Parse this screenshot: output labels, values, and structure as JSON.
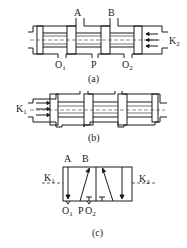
{
  "figure": {
    "panels": [
      {
        "id": "a",
        "caption": "(a)",
        "description": "Spool valve cross-section, spool shifted left by pilot K2",
        "ports": {
          "A": "A",
          "B": "B",
          "P": "P",
          "O1": "O",
          "O1_sub": "1",
          "O2": "O",
          "O2_sub": "2"
        },
        "pilot": {
          "label": "K",
          "sub": "2",
          "side": "right"
        }
      },
      {
        "id": "b",
        "caption": "(b)",
        "description": "Spool valve cross-section, spool shifted right by pilot K1",
        "pilot": {
          "label": "K",
          "sub": "1",
          "side": "left"
        }
      },
      {
        "id": "c",
        "caption": "(c)",
        "description": "Graphic symbol of 2-position 5-way pilot-operated valve",
        "ports": {
          "A": "A",
          "B": "B",
          "P": "P",
          "O1": "O",
          "O1_sub": "1",
          "O2": "O",
          "O2_sub": "2"
        },
        "pilots": [
          {
            "label": "K",
            "sub": "1",
            "side": "left"
          },
          {
            "label": "K",
            "sub": "2",
            "side": "right"
          }
        ]
      }
    ],
    "colors": {
      "line": "#1a1a1a",
      "background": "#ffffff"
    }
  }
}
